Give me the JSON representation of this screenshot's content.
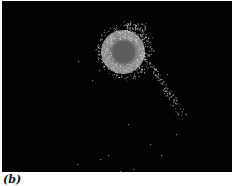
{
  "figure": {
    "panel_label": "(b)",
    "background_color": "#030303",
    "object": {
      "description": "bright speckled disc with darker core and a trailing particle tail",
      "center": [
        121,
        51
      ],
      "outer_radius": 22,
      "inner_radius": 12,
      "disc_color": "#8a8a8a",
      "core_color": "#5e5e5e",
      "speckle_color": "#d8d8d8"
    },
    "tail": {
      "start": [
        148,
        62
      ],
      "end": [
        181,
        117
      ]
    }
  }
}
